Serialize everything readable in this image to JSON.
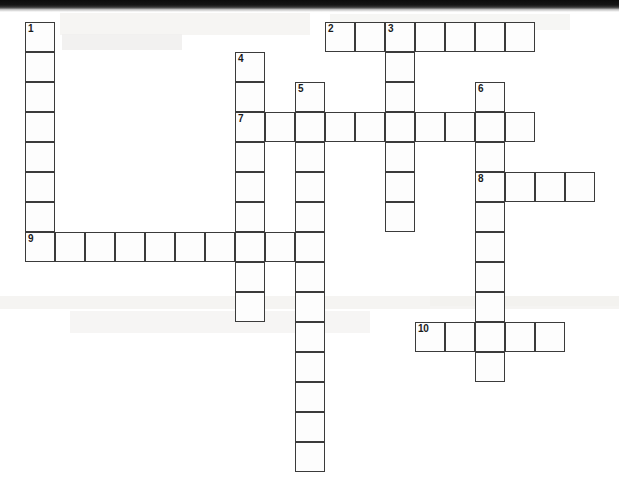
{
  "puzzle": {
    "type": "crossword-grid",
    "cell_size_px": 30,
    "origin_x_px": 25,
    "origin_y_px": 22,
    "columns": 19,
    "rows": 15,
    "cell_border_color": "#3b3b3b",
    "cell_fill_color": "#fdfdfd",
    "page_background_color": "#ffffff",
    "clue_number_color": "#1b1b1b"
  },
  "entries": [
    {
      "number": "1",
      "direction": "down",
      "col": 0,
      "row": 0,
      "length": 8
    },
    {
      "number": "2",
      "direction": "across",
      "col": 10,
      "row": 0,
      "length": 7
    },
    {
      "number": "3",
      "direction": "down",
      "col": 12,
      "row": 0,
      "length": 7
    },
    {
      "number": "4",
      "direction": "down",
      "col": 7,
      "row": 1,
      "length": 9
    },
    {
      "number": "5",
      "direction": "down",
      "col": 9,
      "row": 2,
      "length": 13
    },
    {
      "number": "6",
      "direction": "down",
      "col": 15,
      "row": 2,
      "length": 10
    },
    {
      "number": "7",
      "direction": "across",
      "col": 7,
      "row": 3,
      "length": 10
    },
    {
      "number": "8",
      "direction": "across",
      "col": 15,
      "row": 5,
      "length": 4
    },
    {
      "number": "9",
      "direction": "across",
      "col": 0,
      "row": 7,
      "length": 9
    },
    {
      "number": "10",
      "direction": "across",
      "col": 13,
      "row": 10,
      "length": 5
    }
  ],
  "cells": [
    {
      "col": 0,
      "row": 0,
      "number": "1",
      "letter": ""
    },
    {
      "col": 0,
      "row": 1,
      "number": "",
      "letter": ""
    },
    {
      "col": 0,
      "row": 2,
      "number": "",
      "letter": ""
    },
    {
      "col": 0,
      "row": 3,
      "number": "",
      "letter": ""
    },
    {
      "col": 0,
      "row": 4,
      "number": "",
      "letter": ""
    },
    {
      "col": 0,
      "row": 5,
      "number": "",
      "letter": ""
    },
    {
      "col": 0,
      "row": 6,
      "number": "",
      "letter": ""
    },
    {
      "col": 0,
      "row": 7,
      "number": "9",
      "letter": ""
    },
    {
      "col": 1,
      "row": 7,
      "number": "",
      "letter": ""
    },
    {
      "col": 2,
      "row": 7,
      "number": "",
      "letter": ""
    },
    {
      "col": 3,
      "row": 7,
      "number": "",
      "letter": ""
    },
    {
      "col": 4,
      "row": 7,
      "number": "",
      "letter": ""
    },
    {
      "col": 5,
      "row": 7,
      "number": "",
      "letter": ""
    },
    {
      "col": 6,
      "row": 7,
      "number": "",
      "letter": ""
    },
    {
      "col": 7,
      "row": 7,
      "number": "",
      "letter": ""
    },
    {
      "col": 8,
      "row": 7,
      "number": "",
      "letter": ""
    },
    {
      "col": 7,
      "row": 1,
      "number": "4",
      "letter": ""
    },
    {
      "col": 7,
      "row": 2,
      "number": "",
      "letter": ""
    },
    {
      "col": 7,
      "row": 3,
      "number": "7",
      "letter": ""
    },
    {
      "col": 7,
      "row": 4,
      "number": "",
      "letter": ""
    },
    {
      "col": 7,
      "row": 5,
      "number": "",
      "letter": ""
    },
    {
      "col": 7,
      "row": 6,
      "number": "",
      "letter": ""
    },
    {
      "col": 7,
      "row": 8,
      "number": "",
      "letter": ""
    },
    {
      "col": 7,
      "row": 9,
      "number": "",
      "letter": ""
    },
    {
      "col": 8,
      "row": 3,
      "number": "",
      "letter": ""
    },
    {
      "col": 9,
      "row": 2,
      "number": "5",
      "letter": ""
    },
    {
      "col": 9,
      "row": 3,
      "number": "",
      "letter": ""
    },
    {
      "col": 9,
      "row": 4,
      "number": "",
      "letter": ""
    },
    {
      "col": 9,
      "row": 5,
      "number": "",
      "letter": ""
    },
    {
      "col": 9,
      "row": 6,
      "number": "",
      "letter": ""
    },
    {
      "col": 9,
      "row": 7,
      "number": "",
      "letter": ""
    },
    {
      "col": 9,
      "row": 8,
      "number": "",
      "letter": ""
    },
    {
      "col": 9,
      "row": 9,
      "number": "",
      "letter": ""
    },
    {
      "col": 9,
      "row": 10,
      "number": "",
      "letter": ""
    },
    {
      "col": 9,
      "row": 11,
      "number": "",
      "letter": ""
    },
    {
      "col": 9,
      "row": 12,
      "number": "",
      "letter": ""
    },
    {
      "col": 9,
      "row": 13,
      "number": "",
      "letter": ""
    },
    {
      "col": 9,
      "row": 14,
      "number": "",
      "letter": ""
    },
    {
      "col": 10,
      "row": 0,
      "number": "2",
      "letter": ""
    },
    {
      "col": 11,
      "row": 0,
      "number": "",
      "letter": ""
    },
    {
      "col": 12,
      "row": 0,
      "number": "3",
      "letter": ""
    },
    {
      "col": 13,
      "row": 0,
      "number": "",
      "letter": ""
    },
    {
      "col": 14,
      "row": 0,
      "number": "",
      "letter": ""
    },
    {
      "col": 15,
      "row": 0,
      "number": "",
      "letter": ""
    },
    {
      "col": 16,
      "row": 0,
      "number": "",
      "letter": ""
    },
    {
      "col": 12,
      "row": 1,
      "number": "",
      "letter": ""
    },
    {
      "col": 12,
      "row": 2,
      "number": "",
      "letter": ""
    },
    {
      "col": 12,
      "row": 3,
      "number": "",
      "letter": ""
    },
    {
      "col": 12,
      "row": 4,
      "number": "",
      "letter": ""
    },
    {
      "col": 12,
      "row": 5,
      "number": "",
      "letter": ""
    },
    {
      "col": 12,
      "row": 6,
      "number": "",
      "letter": ""
    },
    {
      "col": 10,
      "row": 3,
      "number": "",
      "letter": ""
    },
    {
      "col": 11,
      "row": 3,
      "number": "",
      "letter": ""
    },
    {
      "col": 13,
      "row": 3,
      "number": "",
      "letter": ""
    },
    {
      "col": 14,
      "row": 3,
      "number": "",
      "letter": ""
    },
    {
      "col": 15,
      "row": 3,
      "number": "",
      "letter": ""
    },
    {
      "col": 16,
      "row": 3,
      "number": "",
      "letter": ""
    },
    {
      "col": 15,
      "row": 2,
      "number": "6",
      "letter": ""
    },
    {
      "col": 15,
      "row": 4,
      "number": "",
      "letter": ""
    },
    {
      "col": 15,
      "row": 5,
      "number": "8",
      "letter": ""
    },
    {
      "col": 15,
      "row": 6,
      "number": "",
      "letter": ""
    },
    {
      "col": 15,
      "row": 7,
      "number": "",
      "letter": ""
    },
    {
      "col": 15,
      "row": 8,
      "number": "",
      "letter": ""
    },
    {
      "col": 15,
      "row": 9,
      "number": "",
      "letter": ""
    },
    {
      "col": 15,
      "row": 10,
      "number": "",
      "letter": ""
    },
    {
      "col": 15,
      "row": 11,
      "number": "",
      "letter": ""
    },
    {
      "col": 16,
      "row": 5,
      "number": "",
      "letter": ""
    },
    {
      "col": 17,
      "row": 5,
      "number": "",
      "letter": ""
    },
    {
      "col": 18,
      "row": 5,
      "number": "",
      "letter": ""
    },
    {
      "col": 13,
      "row": 10,
      "number": "10",
      "letter": ""
    },
    {
      "col": 14,
      "row": 10,
      "number": "",
      "letter": ""
    },
    {
      "col": 16,
      "row": 10,
      "number": "",
      "letter": ""
    },
    {
      "col": 17,
      "row": 10,
      "number": "",
      "letter": ""
    }
  ]
}
